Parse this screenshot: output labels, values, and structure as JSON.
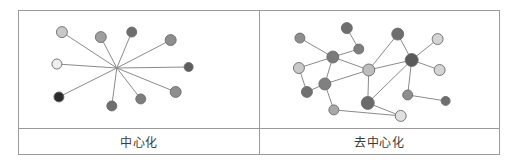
{
  "figure": {
    "type": "two-panel network comparison diagram",
    "panels": [
      {
        "id": "centralized",
        "caption": "中心化",
        "network_type": "star",
        "hub": {
          "x": 98,
          "y": 57,
          "visible_marker": false
        }
      },
      {
        "id": "decentralized",
        "caption": "去中心化",
        "network_type": "mesh"
      }
    ]
  },
  "colors": {
    "frame_border": "#9a9a9a",
    "edge": "#8a8a8a",
    "node_stroke": "#6b6b6b",
    "node_light": "#e8e8e8",
    "node_pale": "#c9c9c9",
    "node_medium": "#9e9e9e",
    "node_dark": "#6e6e6e",
    "node_black": "#2b2b2b",
    "background": "#ffffff",
    "caption_text": "#3a3a3a"
  },
  "chart_data": {
    "type": "diagram",
    "title": "",
    "panels": [
      {
        "name": "中心化",
        "label_en": "Centralized",
        "viewbox": [
          0,
          0,
          240,
          117
        ],
        "nodes": [
          {
            "id": "hub",
            "x": 98,
            "y": 57,
            "r": 0,
            "fill": "none",
            "role": "hub"
          },
          {
            "id": "n1",
            "x": 43,
            "y": 21,
            "r": 5.5,
            "fill": "#c9c9c9"
          },
          {
            "id": "n2",
            "x": 82,
            "y": 26,
            "r": 5.5,
            "fill": "#9e9e9e"
          },
          {
            "id": "n3",
            "x": 113,
            "y": 21,
            "r": 5.0,
            "fill": "#6e6e6e"
          },
          {
            "id": "n4",
            "x": 152,
            "y": 29,
            "r": 5.5,
            "fill": "#8e8e8e"
          },
          {
            "id": "n5",
            "x": 38,
            "y": 53,
            "r": 5.0,
            "fill": "#efefef"
          },
          {
            "id": "n6",
            "x": 170,
            "y": 56,
            "r": 4.5,
            "fill": "#5e5e5e"
          },
          {
            "id": "n7",
            "x": 157,
            "y": 81,
            "r": 5.5,
            "fill": "#8e8e8e"
          },
          {
            "id": "n8",
            "x": 122,
            "y": 88,
            "r": 5.0,
            "fill": "#7e7e7e"
          },
          {
            "id": "n9",
            "x": 93,
            "y": 95,
            "r": 5.0,
            "fill": "#6e6e6e"
          },
          {
            "id": "n10",
            "x": 40,
            "y": 86,
            "r": 5.0,
            "fill": "#2b2b2b"
          }
        ],
        "edges": [
          [
            "hub",
            "n1"
          ],
          [
            "hub",
            "n2"
          ],
          [
            "hub",
            "n3"
          ],
          [
            "hub",
            "n4"
          ],
          [
            "hub",
            "n5"
          ],
          [
            "hub",
            "n6"
          ],
          [
            "hub",
            "n7"
          ],
          [
            "hub",
            "n8"
          ],
          [
            "hub",
            "n9"
          ],
          [
            "hub",
            "n10"
          ]
        ],
        "node_count": 10,
        "edge_count": 10
      },
      {
        "name": "去中心化",
        "label_en": "Decentralized",
        "viewbox": [
          0,
          0,
          240,
          117
        ],
        "nodes": [
          {
            "id": "m1",
            "x": 40,
            "y": 27,
            "r": 5.0,
            "fill": "#8e8e8e"
          },
          {
            "id": "m2",
            "x": 87,
            "y": 17,
            "r": 5.5,
            "fill": "#6e6e6e"
          },
          {
            "id": "m3",
            "x": 99,
            "y": 38,
            "r": 5.0,
            "fill": "#7e7e7e"
          },
          {
            "id": "m4",
            "x": 73,
            "y": 46,
            "r": 6.0,
            "fill": "#7a7a7a"
          },
          {
            "id": "m5",
            "x": 39,
            "y": 57,
            "r": 5.5,
            "fill": "#c9c9c9"
          },
          {
            "id": "m6",
            "x": 65,
            "y": 73,
            "r": 6.0,
            "fill": "#808080"
          },
          {
            "id": "m7",
            "x": 47,
            "y": 81,
            "r": 5.5,
            "fill": "#707070"
          },
          {
            "id": "m8",
            "x": 74,
            "y": 99,
            "r": 5.0,
            "fill": "#a8a8a8"
          },
          {
            "id": "m9",
            "x": 109,
            "y": 59,
            "r": 6.0,
            "fill": "#bdbdbd"
          },
          {
            "id": "m10",
            "x": 108,
            "y": 92,
            "r": 6.5,
            "fill": "#6a6a6a"
          },
          {
            "id": "m11",
            "x": 138,
            "y": 23,
            "r": 6.0,
            "fill": "#6e6e6e"
          },
          {
            "id": "m12",
            "x": 152,
            "y": 49,
            "r": 6.5,
            "fill": "#5a5a5a",
            "role": "secondary-hub"
          },
          {
            "id": "m13",
            "x": 178,
            "y": 28,
            "r": 5.5,
            "fill": "#d4d4d4"
          },
          {
            "id": "m14",
            "x": 180,
            "y": 59,
            "r": 5.5,
            "fill": "#d4d4d4"
          },
          {
            "id": "m15",
            "x": 148,
            "y": 84,
            "r": 5.0,
            "fill": "#8e8e8e"
          },
          {
            "id": "m16",
            "x": 186,
            "y": 90,
            "r": 4.5,
            "fill": "#6e6e6e"
          },
          {
            "id": "m17",
            "x": 141,
            "y": 105,
            "r": 5.5,
            "fill": "#e0e0e0"
          }
        ],
        "edges": [
          [
            "m1",
            "m4"
          ],
          [
            "m2",
            "m3"
          ],
          [
            "m3",
            "m4"
          ],
          [
            "m4",
            "m5"
          ],
          [
            "m4",
            "m6"
          ],
          [
            "m4",
            "m9"
          ],
          [
            "m5",
            "m7"
          ],
          [
            "m6",
            "m7"
          ],
          [
            "m6",
            "m8"
          ],
          [
            "m6",
            "m9"
          ],
          [
            "m8",
            "m17"
          ],
          [
            "m9",
            "m10"
          ],
          [
            "m9",
            "m12"
          ],
          [
            "m10",
            "m12"
          ],
          [
            "m10",
            "m17"
          ],
          [
            "m11",
            "m9"
          ],
          [
            "m11",
            "m12"
          ],
          [
            "m12",
            "m13"
          ],
          [
            "m12",
            "m14"
          ],
          [
            "m12",
            "m15"
          ],
          [
            "m15",
            "m16"
          ]
        ],
        "node_count": 17,
        "edge_count": 21
      }
    ]
  }
}
